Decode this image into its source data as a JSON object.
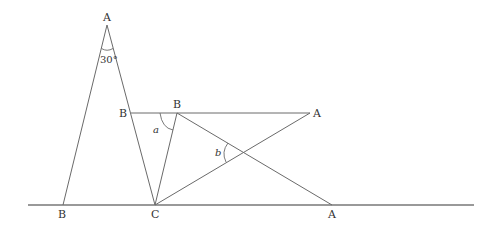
{
  "diagram": {
    "labels": {
      "apex_A": "A",
      "left_B": "B",
      "mid_B": "B",
      "right_A": "A",
      "bottom_B": "B",
      "bottom_C": "C",
      "bottom_A": "A"
    },
    "angles": {
      "apex": "30°",
      "a": "a",
      "b": "b"
    }
  }
}
